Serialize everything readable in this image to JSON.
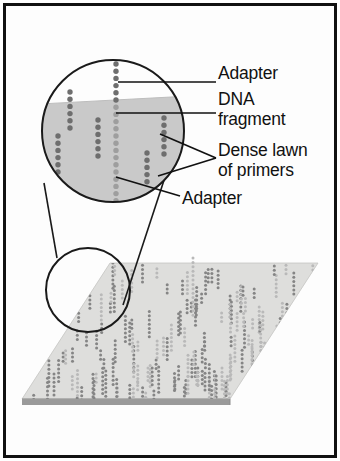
{
  "figure": {
    "background_color": "#fdfdfd",
    "frame_color": "#111111",
    "surface_color": "#dededc",
    "surface_edge_color": "#8d8d8d",
    "circle_fill_color": "#c9c9c9",
    "outline_color": "#1a1a1a",
    "dot_color": "#6e6e6e",
    "primer_dot_color": "#b9b9b9",
    "lawn_dot_color": "#858585"
  },
  "labels": [
    {
      "id": "adapter-top",
      "text": "Adapter",
      "x": 218,
      "y": 73
    },
    {
      "id": "dna-fragment",
      "text": "DNA",
      "x": 218,
      "y": 99
    },
    {
      "id": "dna-fragment-2",
      "text": "fragment",
      "x": 218,
      "y": 119
    },
    {
      "id": "dense-lawn",
      "text": "Dense lawn",
      "x": 218,
      "y": 150
    },
    {
      "id": "dense-lawn-2",
      "text": "of primers",
      "x": 218,
      "y": 170
    },
    {
      "id": "adapter-bottom",
      "text": "Adapter",
      "x": 182,
      "y": 198
    }
  ],
  "magnifier": {
    "large_circle": {
      "cx": 113,
      "cy": 131,
      "r": 71
    },
    "small_circle": {
      "cx": 88,
      "cy": 290,
      "r": 42
    },
    "tangent_lines": [
      {
        "x1": 44,
        "y1": 183,
        "x2": 57,
        "y2": 258
      },
      {
        "x1": 170,
        "y1": 162,
        "x2": 123,
        "y2": 305
      }
    ]
  },
  "leaders": [
    {
      "id": "leader-adapter-top",
      "points": "118,82 216,82"
    },
    {
      "id": "leader-dna-fragment",
      "points": "116,113 216,113"
    },
    {
      "id": "leader-dense-lawn-a",
      "points": "160,134 216,158"
    },
    {
      "id": "leader-dense-lawn-b",
      "points": "158,176 216,158"
    },
    {
      "id": "leader-adapter-bottom",
      "points": "116,177 180,196"
    }
  ],
  "surface": {
    "polygon": "110,263 318,263 230,399 22,399",
    "thickness": 6
  },
  "chart_data": {
    "type": "diagram",
    "annotations": [
      "Adapter",
      "DNA fragment",
      "Dense lawn of primers",
      "Adapter"
    ],
    "magnified_columns": [
      {
        "id": "col-left-upper",
        "x": 70,
        "y_top": 92,
        "count": 6,
        "kind": "primer"
      },
      {
        "id": "col-left-lower",
        "x": 58,
        "y_top": 136,
        "count": 6,
        "kind": "primer"
      },
      {
        "id": "col-center-mid",
        "x": 98,
        "y_top": 120,
        "count": 6,
        "kind": "primer"
      },
      {
        "id": "col-center-main",
        "x": 116,
        "y_top": 64,
        "count": 24,
        "kind": "fragment"
      },
      {
        "id": "col-right-upper",
        "x": 164,
        "y_top": 118,
        "count": 6,
        "kind": "primer"
      },
      {
        "id": "col-right-lower",
        "x": 147,
        "y_top": 153,
        "count": 5,
        "kind": "primer"
      }
    ],
    "surface_cluster_count": 150,
    "tall_cluster": {
      "x": 193,
      "y_top": 258,
      "count": 14
    }
  }
}
